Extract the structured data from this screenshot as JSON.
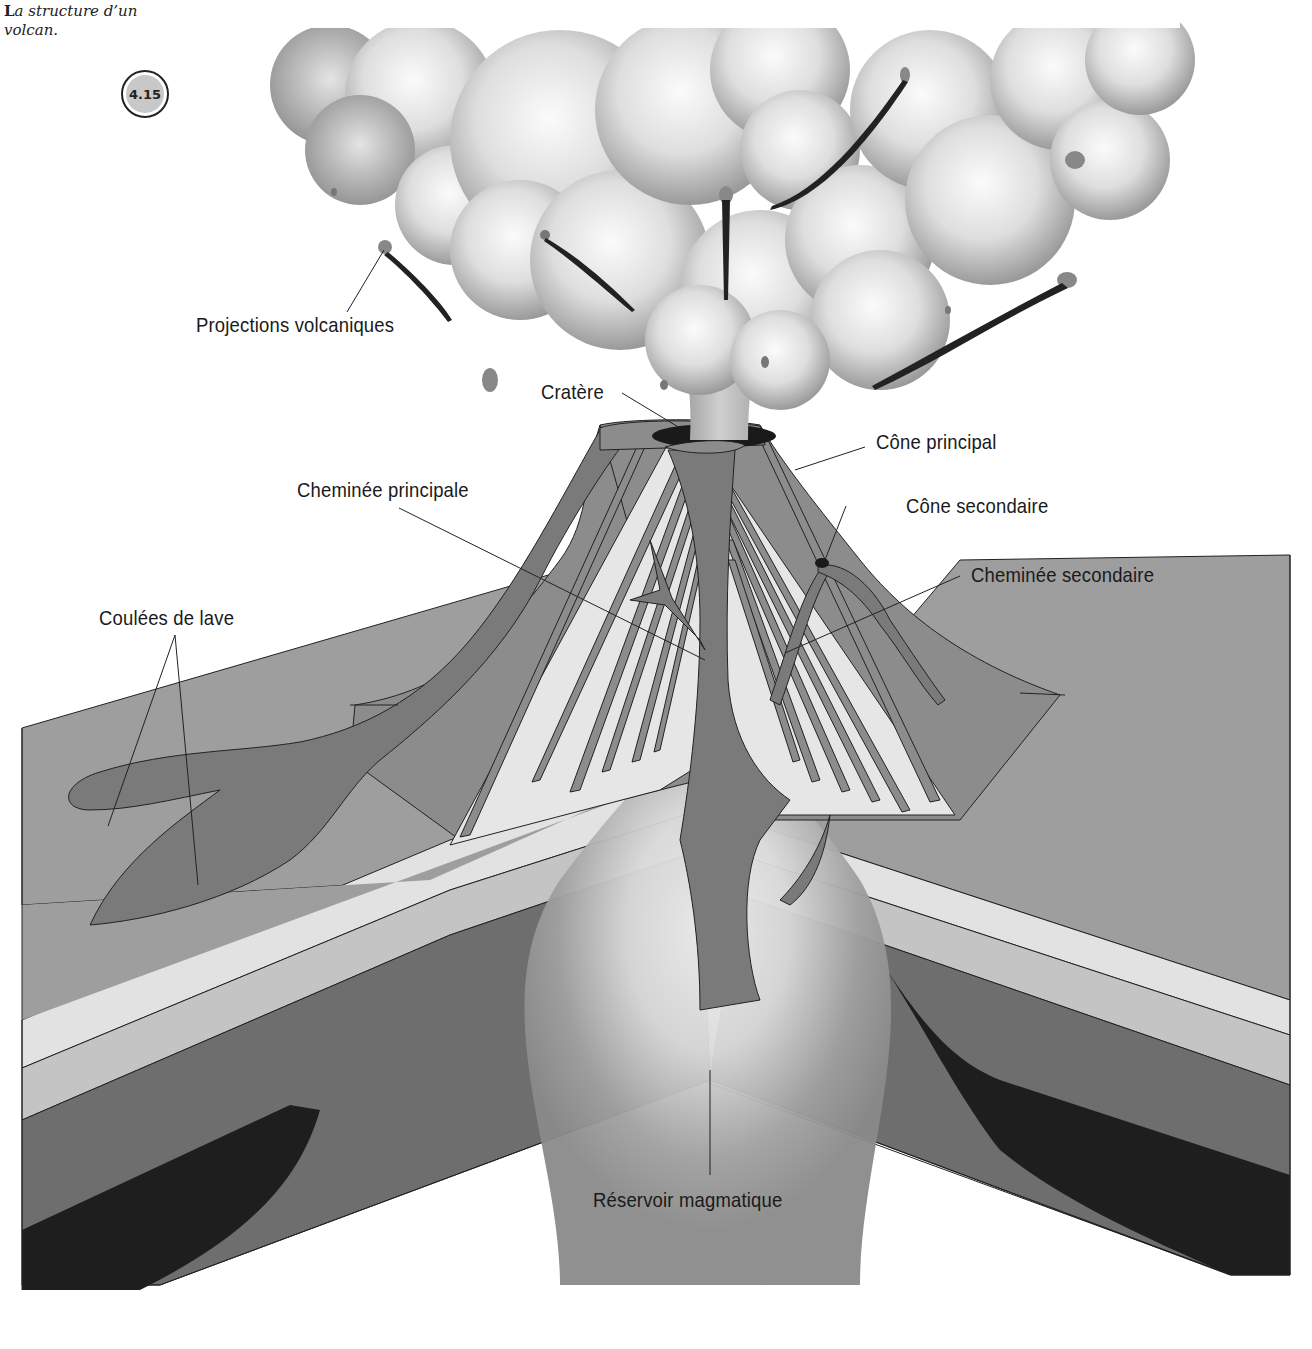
{
  "caption": {
    "dropcap": "L",
    "text": "a structure d’un volcan."
  },
  "figure_number": "4.15",
  "labels": {
    "projections": "Projections volcaniques",
    "cratere": "Cratère",
    "cone_principal": "Cône principal",
    "cheminee_principale": "Cheminée principale",
    "cone_secondaire": "Cône secondaire",
    "cheminee_secondaire": "Cheminée secondaire",
    "coulees": "Coulées de lave",
    "reservoir": "Réservoir magmatique"
  },
  "colors": {
    "background": "#ffffff",
    "cloud_light": "#f2f2f2",
    "cloud_dark": "#9a9a9a",
    "cone": "#8c8c8c",
    "lava": "#7a7a7a",
    "surface": "#9e9e9e",
    "layer_light": "#e2e2e2",
    "layer_mid": "#c4c4c4",
    "layer_dark": "#6e6e6e",
    "layer_black": "#1e1e1e",
    "crater": "#1a1a1a",
    "outline": "#222222",
    "text": "#1a1a1a"
  }
}
